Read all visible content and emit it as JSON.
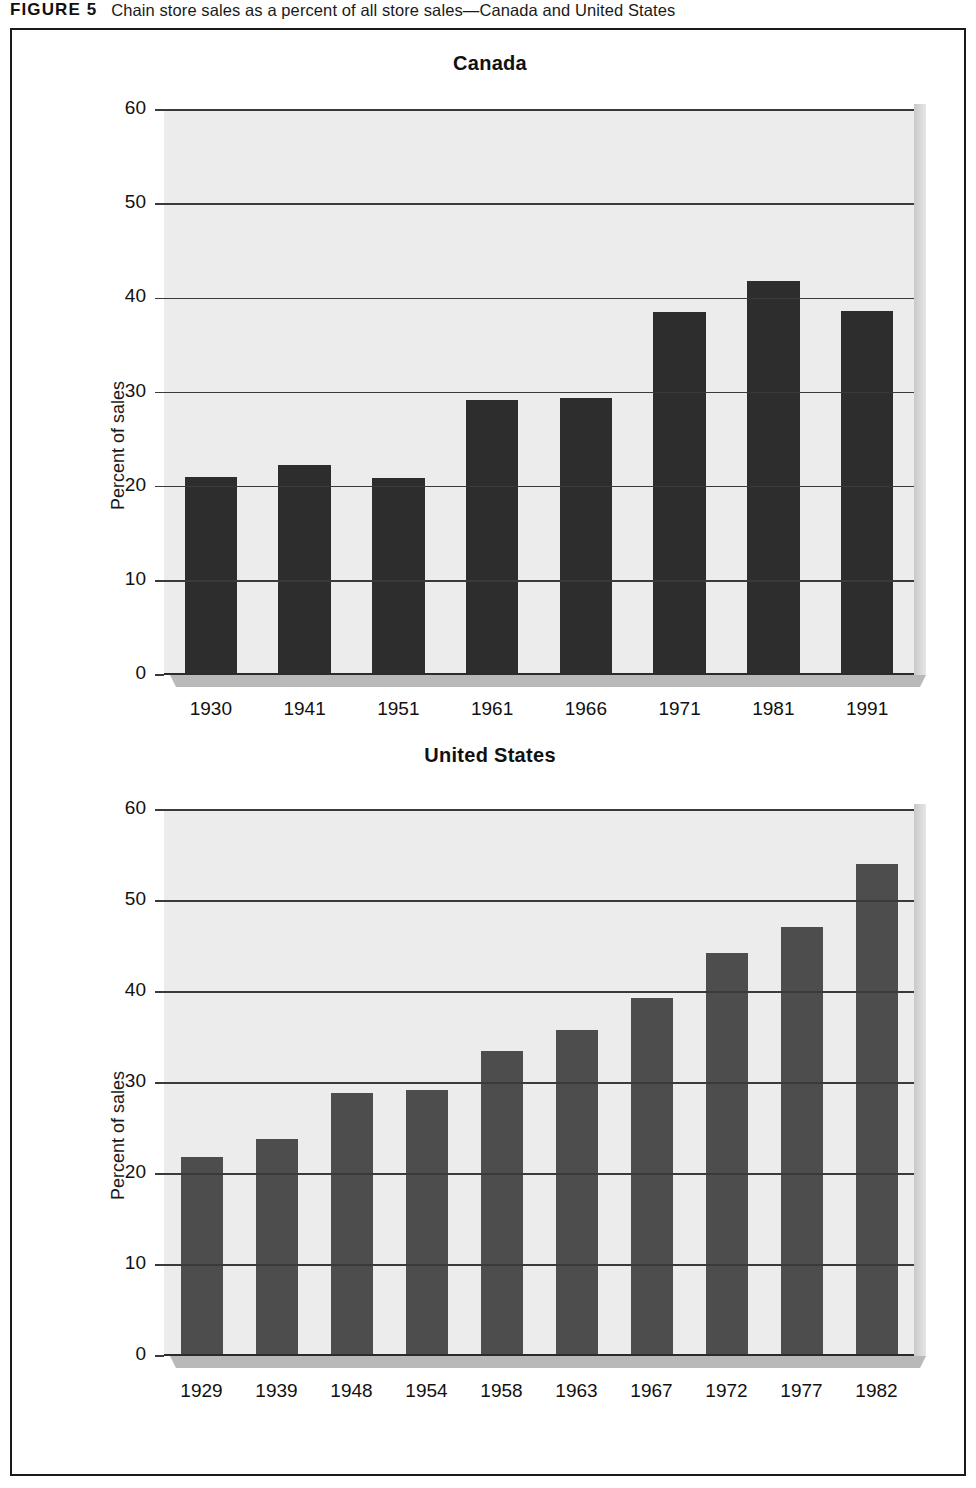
{
  "caption": {
    "figure_label": "FIGURE 5",
    "title": "Chain store sales as a percent of all store sales—Canada and United States"
  },
  "colors": {
    "plot_background": "#ececec",
    "canada_bar": "#2d2d2d",
    "us_bar": "#4d4d4d",
    "gridline": "#3a3a3a",
    "frame_border": "#1a1a1a"
  },
  "chart_data": [
    {
      "type": "bar",
      "title": "Canada",
      "xlabel": "",
      "ylabel": "Percent of sales",
      "ylim": [
        0,
        60
      ],
      "yticks": [
        0,
        10,
        20,
        30,
        40,
        50,
        60
      ],
      "grid": true,
      "legend": "none",
      "categories": [
        "1930",
        "1941",
        "1951",
        "1961",
        "1966",
        "1971",
        "1981",
        "1991"
      ],
      "values": [
        21.0,
        22.3,
        20.9,
        29.2,
        29.4,
        38.6,
        41.8,
        38.7
      ]
    },
    {
      "type": "bar",
      "title": "United States",
      "xlabel": "",
      "ylabel": "Percent of sales",
      "ylim": [
        0,
        60
      ],
      "yticks": [
        0,
        10,
        20,
        30,
        40,
        50,
        60
      ],
      "grid": true,
      "legend": "none",
      "categories": [
        "1929",
        "1939",
        "1948",
        "1954",
        "1958",
        "1963",
        "1967",
        "1972",
        "1977",
        "1982"
      ],
      "values": [
        21.9,
        23.8,
        28.9,
        29.2,
        33.5,
        35.8,
        39.3,
        44.3,
        47.1,
        54.1
      ]
    }
  ]
}
